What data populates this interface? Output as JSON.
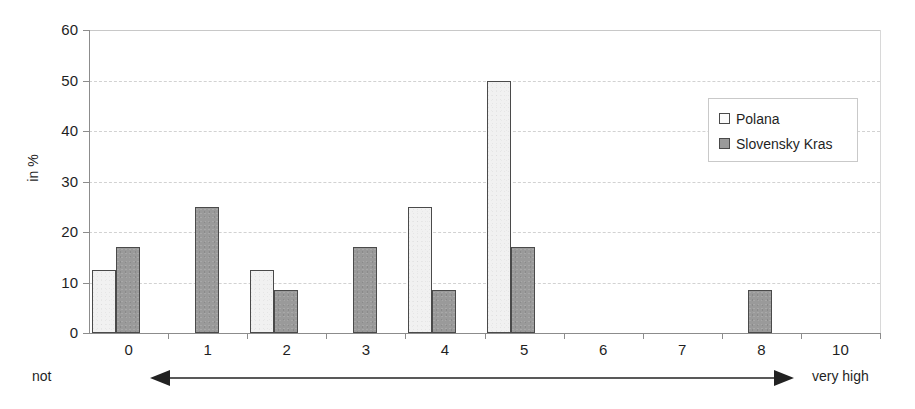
{
  "chart_data": {
    "type": "bar",
    "title": "",
    "xlabel": "",
    "ylabel": "in %",
    "categories": [
      "0",
      "1",
      "2",
      "3",
      "4",
      "5",
      "6",
      "7",
      "8",
      "10"
    ],
    "series": [
      {
        "name": "Polana",
        "color": "#f1f1f1",
        "values": [
          12.5,
          0,
          12.5,
          0,
          25,
          50,
          0,
          0,
          0,
          0
        ]
      },
      {
        "name": "Slovensky Kras",
        "color": "#9a9a9a",
        "values": [
          17,
          25,
          8.5,
          17,
          8.5,
          17,
          0,
          0,
          8.5,
          0
        ]
      }
    ],
    "ylim": [
      0,
      60
    ],
    "yticks": [
      0,
      10,
      20,
      30,
      40,
      50,
      60
    ],
    "ytick_labels": [
      "0",
      "10",
      "20",
      "30",
      "40",
      "50",
      "60"
    ],
    "grid": true,
    "legend_position": "top-right"
  },
  "axis": {
    "y_title": "in %"
  },
  "scale": {
    "left_caption": "not",
    "right_caption": "very high",
    "arrow": "double-headed-horizontal-arrow"
  },
  "legend": {
    "items": [
      {
        "label": "Polana",
        "swatch": "light-square"
      },
      {
        "label": "Slovensky Kras",
        "swatch": "dark-square"
      }
    ]
  }
}
